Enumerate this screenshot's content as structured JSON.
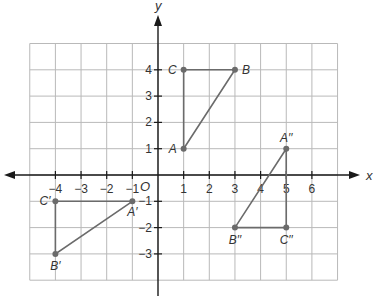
{
  "diagram": {
    "type": "coordinate-plane",
    "axes": {
      "x_label": "x",
      "y_label": "y",
      "origin_label": "O",
      "x_ticks": [
        "-4",
        "-3",
        "-2",
        "-1",
        "1",
        "2",
        "3",
        "4",
        "5",
        "6"
      ],
      "y_ticks": [
        "4",
        "3",
        "2",
        "1",
        "-1",
        "-2",
        "-3"
      ],
      "grid_x_range": [
        -5,
        7
      ],
      "grid_y_range": [
        -4,
        5
      ]
    },
    "figures": [
      {
        "name": "triangle ABC",
        "points": [
          {
            "label": "A",
            "x": 1,
            "y": 1
          },
          {
            "label": "B",
            "x": 3,
            "y": 4
          },
          {
            "label": "C",
            "x": 1,
            "y": 4
          }
        ]
      },
      {
        "name": "triangle A'B'C'",
        "points": [
          {
            "label": "A′",
            "x": -1,
            "y": -1
          },
          {
            "label": "B′",
            "x": -4,
            "y": -3
          },
          {
            "label": "C′",
            "x": -4,
            "y": -1
          }
        ]
      },
      {
        "name": "triangle A''B''C''",
        "points": [
          {
            "label": "A′′",
            "x": 5,
            "y": 1
          },
          {
            "label": "B′′",
            "x": 3,
            "y": -2
          },
          {
            "label": "C′′",
            "x": 5,
            "y": -2
          }
        ]
      }
    ]
  }
}
